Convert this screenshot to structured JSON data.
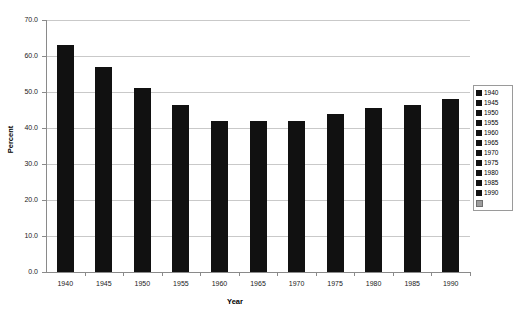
{
  "chart_data": {
    "type": "bar",
    "title": "",
    "xlabel": "Year",
    "ylabel": "Percent",
    "categories": [
      "1940",
      "1945",
      "1950",
      "1955",
      "1960",
      "1965",
      "1970",
      "1975",
      "1980",
      "1985",
      "1990"
    ],
    "values": [
      63.0,
      57.0,
      51.0,
      46.5,
      42.0,
      42.0,
      42.0,
      44.0,
      45.5,
      46.5,
      48.0
    ],
    "ylim": [
      0.0,
      70.0
    ],
    "ytick_labels": [
      "0.0",
      "10.0",
      "20.0",
      "30.0",
      "40.0",
      "50.0",
      "60.0",
      "70.0"
    ],
    "ytick_values": [
      0,
      10,
      20,
      30,
      40,
      50,
      60,
      70
    ],
    "grid": true,
    "bar_color": "#111111",
    "gridline_color": "#c9c9c9",
    "axis_color": "#8a8a8a",
    "background": "#ffffff",
    "legend": {
      "position": "right",
      "entries": [
        {
          "label": "1940",
          "marker": "black-square"
        },
        {
          "label": "1945",
          "marker": "black-square"
        },
        {
          "label": "1950",
          "marker": "black-square"
        },
        {
          "label": "1955",
          "marker": "black-square"
        },
        {
          "label": "1960",
          "marker": "black-square"
        },
        {
          "label": "1965",
          "marker": "black-square"
        },
        {
          "label": "1970",
          "marker": "black-square"
        },
        {
          "label": "1975",
          "marker": "black-square"
        },
        {
          "label": "1980",
          "marker": "black-square"
        },
        {
          "label": "1985",
          "marker": "black-square"
        },
        {
          "label": "1990",
          "marker": "black-square"
        },
        {
          "label": "",
          "marker": "gray-square"
        }
      ]
    }
  }
}
